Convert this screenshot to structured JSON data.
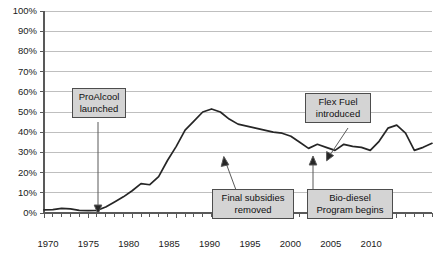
{
  "chart_data": {
    "type": "line",
    "title": "",
    "subtitle": "",
    "xlabel": "",
    "ylabel": "",
    "xlim": [
      1970,
      2014
    ],
    "ylim": [
      0,
      100
    ],
    "grid": true,
    "legend": "none",
    "yticklabels": [
      "0%",
      "10%",
      "20%",
      "30%",
      "40%",
      "50%",
      "60%",
      "70%",
      "80%",
      "90%",
      "100%"
    ],
    "yticks": [
      0,
      10,
      20,
      30,
      40,
      50,
      60,
      70,
      80,
      90,
      100
    ],
    "xticklabels": [
      "1970",
      "1975",
      "1980",
      "1985",
      "1990",
      "1995",
      "2000",
      "2005",
      "2010"
    ],
    "xticks": [
      1970,
      1975,
      1980,
      1985,
      1990,
      1995,
      2000,
      2005,
      2010
    ],
    "minor_xtick_interval": 1,
    "series": [
      {
        "name": "Ethanol share of fuel",
        "color": "#262626",
        "x": [
          1970,
          1971,
          1972,
          1973,
          1974,
          1975,
          1976,
          1977,
          1978,
          1979,
          1980,
          1981,
          1982,
          1983,
          1984,
          1985,
          1986,
          1987,
          1988,
          1989,
          1990,
          1991,
          1992,
          1993,
          1994,
          1995,
          1996,
          1997,
          1998,
          1999,
          2000,
          2001,
          2002,
          2003,
          2004,
          2005,
          2006,
          2007,
          2008,
          2009,
          2010,
          2011,
          2012,
          2013,
          2014
        ],
        "values": [
          1.5,
          1.7,
          2.3,
          2.0,
          1.3,
          1.2,
          1.3,
          3.0,
          5.5,
          8.0,
          11.0,
          14.5,
          14.0,
          18.0,
          26.0,
          33.0,
          41.0,
          45.5,
          50.0,
          51.5,
          50.0,
          46.5,
          44.0,
          43.0,
          42.0,
          41.0,
          40.0,
          39.5,
          38.0,
          35.0,
          32.0,
          34.0,
          32.5,
          31.0,
          34.0,
          33.0,
          32.5,
          31.0,
          35.5,
          42.0,
          43.5,
          39.5,
          31.0,
          32.5,
          34.5
        ]
      }
    ],
    "annotations": [
      {
        "id": "proalcool",
        "lines": [
          "ProAlcool",
          "launched"
        ],
        "target_x": 1976,
        "target_y": 0
      },
      {
        "id": "final-subsidies",
        "lines": [
          "Final subsidies",
          "removed"
        ],
        "target_x": 1999,
        "target_y": 32
      },
      {
        "id": "flex-fuel",
        "lines": [
          "Flex Fuel",
          "introduced"
        ],
        "target_x": 2003,
        "target_y": 31
      },
      {
        "id": "bio-diesel",
        "lines": [
          "Bio-diesel",
          "Program begins"
        ],
        "target_x": 2005,
        "target_y": 33
      }
    ]
  },
  "axis": {
    "y": {
      "t100": "100%",
      "t90": "90%",
      "t80": "80%",
      "t70": "70%",
      "t60": "60%",
      "t50": "50%",
      "t40": "40%",
      "t30": "30%",
      "t20": "20%",
      "t10": "10%",
      "t0": "0%"
    },
    "x": {
      "t1970": "1970",
      "t1975": "1975",
      "t1980": "1980",
      "t1985": "1985",
      "t1990": "1990",
      "t1995": "1995",
      "t2000": "2000",
      "t2005": "2005",
      "t2010": "2010"
    }
  },
  "callouts": {
    "proalcool": {
      "line1": "ProAlcool",
      "line2": "launched"
    },
    "final_subsidies": {
      "line1": "Final subsidies",
      "line2": "removed"
    },
    "flex_fuel": {
      "line1": "Flex Fuel",
      "line2": "introduced"
    },
    "bio_diesel": {
      "line1": "Bio-diesel",
      "line2": "Program begins"
    }
  },
  "colors": {
    "line": "#262626",
    "grid": "#bfbfbf",
    "axis": "#595959",
    "callout_fill": "#d4d4d4",
    "callout_border": "#4d4d4d",
    "text": "#1a1a1a"
  }
}
